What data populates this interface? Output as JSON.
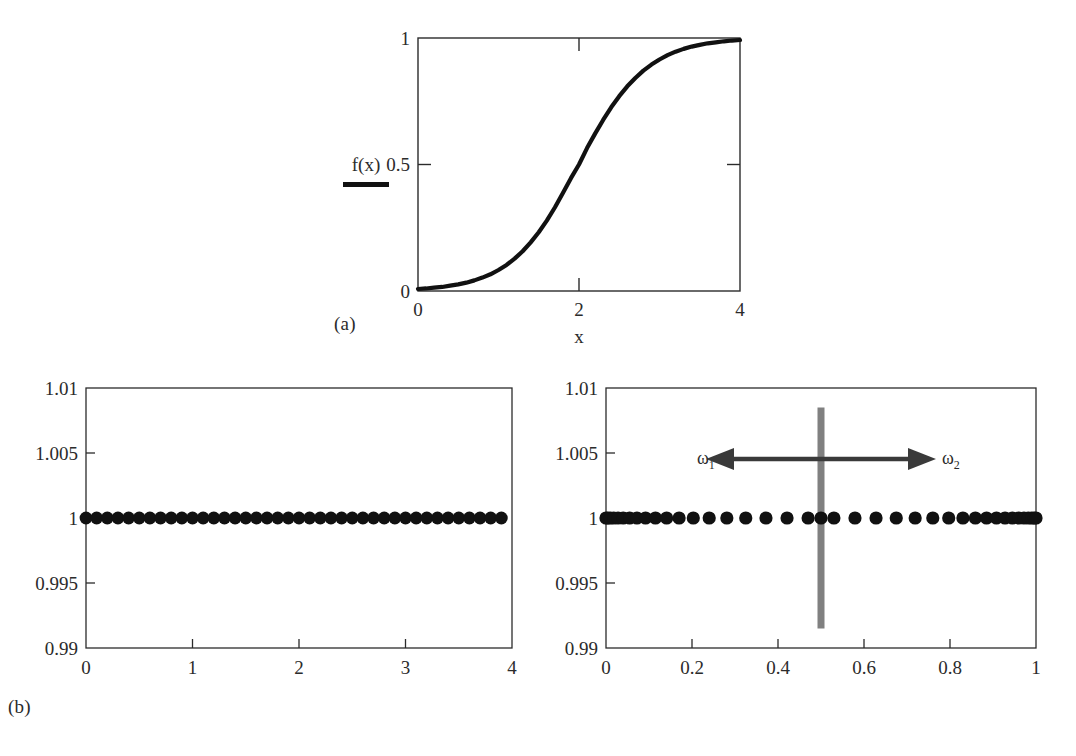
{
  "figure": {
    "captions": [
      {
        "id": "caption-a",
        "text": "(a)"
      },
      {
        "id": "caption-b",
        "text": "(b)"
      }
    ]
  },
  "panel_a": {
    "legend": {
      "label": "f(x)",
      "color": "#111111"
    },
    "xlabel": "x",
    "ylabel": "",
    "xticks": [
      "0",
      "2",
      "4"
    ],
    "yticks": [
      "0",
      "0.5",
      "1"
    ]
  },
  "panel_b_left": {
    "xticks": [
      "0",
      "1",
      "2",
      "3",
      "4"
    ],
    "yticks": [
      "0.99",
      "0.995",
      "1",
      "1.005",
      "1.01"
    ]
  },
  "panel_b_right": {
    "xticks": [
      "0",
      "0.2",
      "0.4",
      "0.6",
      "0.8",
      "1"
    ],
    "yticks": [
      "0.99",
      "0.995",
      "1",
      "1.005",
      "1.01"
    ],
    "annotations": {
      "omega1": "ω",
      "omega1_sub": "1",
      "omega2": "ω",
      "omega2_sub": "2",
      "divider_color": "#808080",
      "divider_x": 0.5
    }
  },
  "chart_data": [
    {
      "id": "panel-a",
      "type": "line",
      "title": "",
      "xlabel": "x",
      "ylabel": "f(x)",
      "xlim": [
        0,
        4
      ],
      "ylim": [
        0,
        1
      ],
      "xticks": [
        0,
        2,
        4
      ],
      "yticks": [
        0,
        0.5,
        1
      ],
      "grid": false,
      "legend": [
        "f(x)"
      ],
      "legend_position": "left-outside",
      "series": [
        {
          "name": "f(x)",
          "color": "#111111",
          "comment": "logistic sigmoid 1/(1+exp(-(x-2)/0.42)) sampled on [0,4]",
          "x": [
            0,
            0.1,
            0.2,
            0.3,
            0.4,
            0.5,
            0.6,
            0.7,
            0.8,
            0.9,
            1.0,
            1.1,
            1.2,
            1.3,
            1.4,
            1.5,
            1.6,
            1.7,
            1.8,
            1.9,
            2.0,
            2.1,
            2.2,
            2.3,
            2.4,
            2.5,
            2.6,
            2.7,
            2.8,
            2.9,
            3.0,
            3.1,
            3.2,
            3.3,
            3.4,
            3.5,
            3.6,
            3.7,
            3.8,
            3.9,
            4.0
          ],
          "y": [
            0.008,
            0.01,
            0.013,
            0.016,
            0.021,
            0.026,
            0.033,
            0.042,
            0.053,
            0.066,
            0.083,
            0.103,
            0.128,
            0.157,
            0.192,
            0.232,
            0.278,
            0.33,
            0.387,
            0.446,
            0.5,
            0.565,
            0.622,
            0.676,
            0.726,
            0.77,
            0.809,
            0.842,
            0.871,
            0.895,
            0.915,
            0.932,
            0.946,
            0.957,
            0.966,
            0.973,
            0.979,
            0.983,
            0.987,
            0.99,
            0.992
          ]
        }
      ]
    },
    {
      "id": "panel-b-left",
      "type": "scatter",
      "title": "",
      "xlabel": "",
      "ylabel": "",
      "xlim": [
        0,
        4
      ],
      "ylim": [
        0.99,
        1.01
      ],
      "xticks": [
        0,
        1,
        2,
        3,
        4
      ],
      "yticks": [
        0.99,
        0.995,
        1,
        1.005,
        1.01
      ],
      "grid": false,
      "marker": "filled-circle",
      "marker_color": "#111111",
      "series": [
        {
          "name": "uniform nodes",
          "comment": "40 uniformly spaced nodes on [0,3.9], all with value 1",
          "x": [
            0,
            0.1,
            0.2,
            0.3,
            0.4,
            0.5,
            0.6,
            0.7,
            0.8,
            0.9,
            1.0,
            1.1,
            1.2,
            1.3,
            1.4,
            1.5,
            1.6,
            1.7,
            1.8,
            1.9,
            2.0,
            2.1,
            2.2,
            2.3,
            2.4,
            2.5,
            2.6,
            2.7,
            2.8,
            2.9,
            3.0,
            3.1,
            3.2,
            3.3,
            3.4,
            3.5,
            3.6,
            3.7,
            3.8,
            3.9
          ],
          "y": [
            1,
            1,
            1,
            1,
            1,
            1,
            1,
            1,
            1,
            1,
            1,
            1,
            1,
            1,
            1,
            1,
            1,
            1,
            1,
            1,
            1,
            1,
            1,
            1,
            1,
            1,
            1,
            1,
            1,
            1,
            1,
            1,
            1,
            1,
            1,
            1,
            1,
            1,
            1,
            1
          ]
        }
      ]
    },
    {
      "id": "panel-b-right",
      "type": "scatter",
      "title": "",
      "xlabel": "",
      "ylabel": "",
      "xlim": [
        0,
        1
      ],
      "ylim": [
        0.99,
        1.01
      ],
      "xticks": [
        0,
        0.2,
        0.4,
        0.6,
        0.8,
        1
      ],
      "yticks": [
        0.99,
        0.995,
        1,
        1.005,
        1.01
      ],
      "grid": false,
      "marker": "filled-circle",
      "marker_color": "#111111",
      "annotations": [
        {
          "type": "vline",
          "x": 0.5,
          "color": "#808080",
          "y_from": 0.9915,
          "y_to": 1.0085
        },
        {
          "type": "double-arrow",
          "y": 1.005,
          "x_from": 0.27,
          "x_to": 0.74,
          "color": "#3a3a3a"
        },
        {
          "type": "text",
          "text": "ω1",
          "x": 0.23,
          "y": 1.005
        },
        {
          "type": "text",
          "text": "ω2",
          "x": 0.78,
          "y": 1.005
        }
      ],
      "series": [
        {
          "name": "clustered (Chebyshev-like) nodes",
          "comment": "nodes clustered toward both endpoints, all with value 1",
          "x": [
            0.0,
            0.004,
            0.01,
            0.018,
            0.028,
            0.04,
            0.055,
            0.072,
            0.092,
            0.115,
            0.141,
            0.17,
            0.203,
            0.24,
            0.281,
            0.325,
            0.372,
            0.421,
            0.47,
            0.5,
            0.53,
            0.579,
            0.628,
            0.675,
            0.719,
            0.76,
            0.797,
            0.83,
            0.859,
            0.885,
            0.908,
            0.928,
            0.945,
            0.96,
            0.972,
            0.982,
            0.99,
            0.996,
            1.0
          ],
          "y": [
            1,
            1,
            1,
            1,
            1,
            1,
            1,
            1,
            1,
            1,
            1,
            1,
            1,
            1,
            1,
            1,
            1,
            1,
            1,
            1,
            1,
            1,
            1,
            1,
            1,
            1,
            1,
            1,
            1,
            1,
            1,
            1,
            1,
            1,
            1,
            1,
            1,
            1,
            1
          ]
        }
      ]
    }
  ]
}
